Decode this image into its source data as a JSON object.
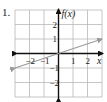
{
  "problem_number": "1.",
  "chart_data": {
    "type": "line",
    "title": "",
    "xlabel": "x",
    "ylabel": "f(x)",
    "xlim": [
      -3,
      3
    ],
    "ylim": [
      -3,
      3
    ],
    "grid": true,
    "x_ticks": [
      "-2",
      "-1",
      "1",
      "2"
    ],
    "y_ticks": [
      "2",
      "1",
      "-1",
      "-2"
    ],
    "series": [
      {
        "name": "f(x)",
        "equation": "f(x) = x/3",
        "color": "#9a9a9a",
        "x": [
          -3,
          0,
          3
        ],
        "y": [
          -1,
          0,
          1
        ],
        "arrows": "both"
      }
    ]
  },
  "colors": {
    "grid": "#b8b8b8",
    "axes": "#111111",
    "line": "#9a9a9a"
  }
}
